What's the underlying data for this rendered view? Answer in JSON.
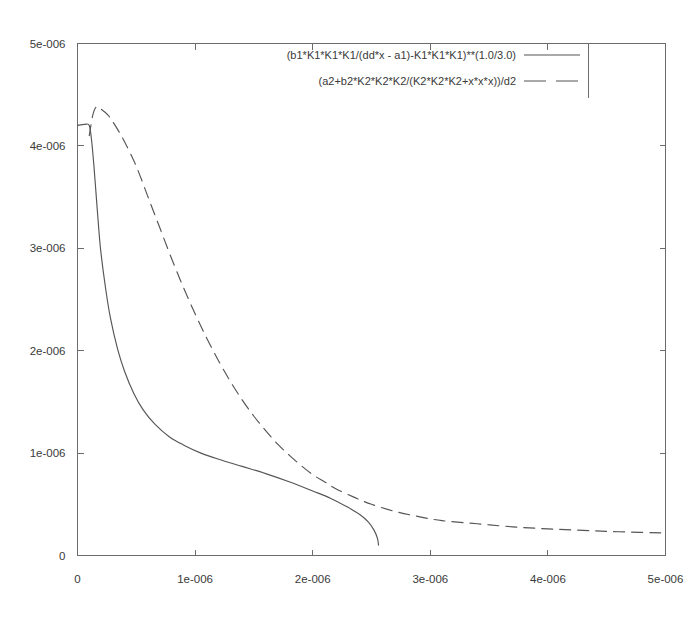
{
  "chart_data": {
    "type": "line",
    "title": "",
    "xlabel": "",
    "ylabel": "",
    "xlim": [
      0,
      5e-06
    ],
    "ylim": [
      0,
      5e-06
    ],
    "grid": false,
    "legend_position": "top-right",
    "x_ticks": [
      {
        "value": 0,
        "label": "0"
      },
      {
        "value": 1e-06,
        "label": "1e-006"
      },
      {
        "value": 2e-06,
        "label": "2e-006"
      },
      {
        "value": 3e-06,
        "label": "3e-006"
      },
      {
        "value": 4e-06,
        "label": "4e-006"
      },
      {
        "value": 5e-06,
        "label": "5e-006"
      }
    ],
    "y_ticks": [
      {
        "value": 0,
        "label": "0"
      },
      {
        "value": 1e-06,
        "label": "1e-006"
      },
      {
        "value": 2e-06,
        "label": "2e-006"
      },
      {
        "value": 3e-06,
        "label": "3e-006"
      },
      {
        "value": 4e-06,
        "label": "4e-006"
      },
      {
        "value": 5e-06,
        "label": "5e-006"
      }
    ],
    "series": [
      {
        "name": "(b1*K1*K1*K1/(dd*x - a1)-K1*K1*K1)**(1.0/3.0)",
        "style": "solid",
        "color": "#555555",
        "points": [
          [
            0.0,
            4.2e-06
          ],
          [
            6e-08,
            4.21e-06
          ],
          [
            1e-07,
            4.2e-06
          ],
          [
            1.2e-07,
            4.05e-06
          ],
          [
            1.4e-07,
            3.8e-06
          ],
          [
            1.6e-07,
            3.5e-06
          ],
          [
            1.8e-07,
            3.2e-06
          ],
          [
            2e-07,
            2.95e-06
          ],
          [
            2.4e-07,
            2.6e-06
          ],
          [
            2.8e-07,
            2.32e-06
          ],
          [
            3.4e-07,
            2.02e-06
          ],
          [
            4e-07,
            1.8e-06
          ],
          [
            4.8e-07,
            1.58e-06
          ],
          [
            5.6e-07,
            1.42e-06
          ],
          [
            6.6e-07,
            1.28e-06
          ],
          [
            7.8e-07,
            1.16e-06
          ],
          [
            9e-07,
            1.08e-06
          ],
          [
            1.05e-06,
            1e-06
          ],
          [
            1.2e-06,
            9.4e-07
          ],
          [
            1.4e-06,
            8.7e-07
          ],
          [
            1.6e-06,
            8e-07
          ],
          [
            1.8e-06,
            7.2e-07
          ],
          [
            2e-06,
            6.3e-07
          ],
          [
            2.15e-06,
            5.6e-07
          ],
          [
            2.3e-06,
            4.7e-07
          ],
          [
            2.4e-06,
            4e-07
          ],
          [
            2.47e-06,
            3.3e-07
          ],
          [
            2.52e-06,
            2.5e-07
          ],
          [
            2.55e-06,
            1.7e-07
          ],
          [
            2.56e-06,
            1e-07
          ]
        ]
      },
      {
        "name": "(a2+b2*K2*K2*K2/(K2*K2*K2+x*x*x))/d2",
        "style": "dashed",
        "color": "#555555",
        "points": [
          [
            1e-07,
            4.1e-06
          ],
          [
            1.3e-07,
            4.3e-06
          ],
          [
            1.6e-07,
            4.38e-06
          ],
          [
            2e-07,
            4.36e-06
          ],
          [
            2.6e-07,
            4.3e-06
          ],
          [
            3.2e-07,
            4.2e-06
          ],
          [
            4e-07,
            4.04e-06
          ],
          [
            5e-07,
            3.8e-06
          ],
          [
            6e-07,
            3.5e-06
          ],
          [
            7e-07,
            3.2e-06
          ],
          [
            8e-07,
            2.9e-06
          ],
          [
            9e-07,
            2.62e-06
          ],
          [
            1e-06,
            2.36e-06
          ],
          [
            1.1e-06,
            2.12e-06
          ],
          [
            1.2e-06,
            1.9e-06
          ],
          [
            1.3e-06,
            1.7e-06
          ],
          [
            1.4e-06,
            1.52e-06
          ],
          [
            1.5e-06,
            1.36e-06
          ],
          [
            1.6e-06,
            1.22e-06
          ],
          [
            1.7e-06,
            1.09e-06
          ],
          [
            1.8e-06,
            9.8e-07
          ],
          [
            1.9e-06,
            8.8e-07
          ],
          [
            2e-06,
            7.9e-07
          ],
          [
            2.1e-06,
            7.2e-07
          ],
          [
            2.2e-06,
            6.5e-07
          ],
          [
            2.35e-06,
            5.7e-07
          ],
          [
            2.5e-06,
            5e-07
          ],
          [
            2.7e-06,
            4.3e-07
          ],
          [
            2.9e-06,
            3.8e-07
          ],
          [
            3.1e-06,
            3.4e-07
          ],
          [
            3.4e-06,
            3.1e-07
          ],
          [
            3.7e-06,
            2.8e-07
          ],
          [
            4e-06,
            2.6e-07
          ],
          [
            4.3e-06,
            2.45e-07
          ],
          [
            4.6e-06,
            2.32e-07
          ],
          [
            5e-06,
            2.2e-07
          ]
        ]
      }
    ]
  },
  "legend": {
    "entries": [
      {
        "label": "(b1*K1*K1*K1/(dd*x - a1)-K1*K1*K1)**(1.0/3.0)",
        "style": "solid"
      },
      {
        "label": "(a2+b2*K2*K2*K2/(K2*K2*K2+x*x*x))/d2",
        "style": "dashed"
      }
    ]
  }
}
